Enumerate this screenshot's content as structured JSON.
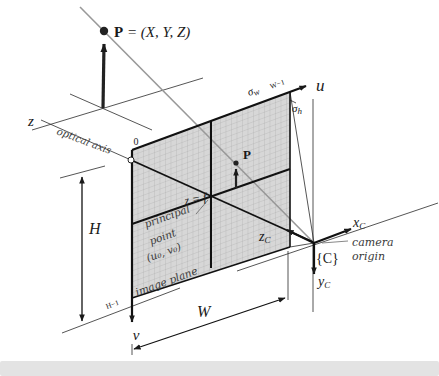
{
  "figure": {
    "point3d": {
      "bold": "P",
      "rest": " = (X, Y, Z)"
    },
    "world": {
      "z_axis": "z",
      "optical_axis": "optical axis",
      "origin_tick": "0"
    },
    "pixel_axes": {
      "u": "u",
      "v": "v",
      "sigma": "σ",
      "sigma_w_sub": "w",
      "sigma_h_sub": "h",
      "w_minus_one": "W−1",
      "h_minus_one": "H−1"
    },
    "dimensions": {
      "height": "H",
      "width": "W"
    },
    "plane": {
      "z_eq_f": "z = f",
      "principal_1": "principal",
      "principal_2": "point",
      "principal_3": "(u₀, v₀)",
      "image_plane": "image plane",
      "projected_point": "P"
    },
    "camera": {
      "x": "x",
      "y": "y",
      "z": "z",
      "sub": "C",
      "frame": "{C}",
      "origin_1": "camera",
      "origin_2": "origin"
    },
    "colors": {
      "ink": "#1a1a1a",
      "ray": "#999999",
      "grid_fill": "#d7d7d7",
      "grid_line": "#a6a6a6",
      "annotation": "#3a3a3a",
      "footer_bar": "#e3e3e3"
    }
  }
}
